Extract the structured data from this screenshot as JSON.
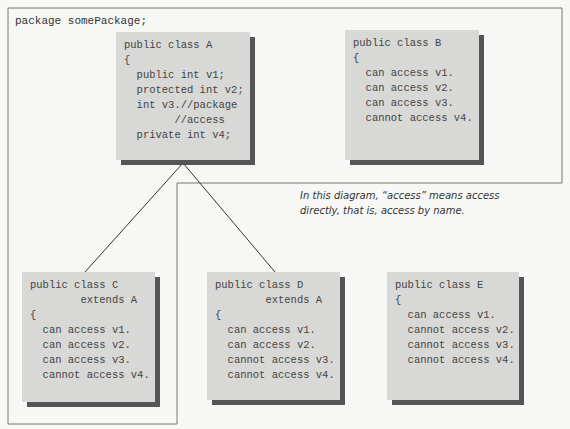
{
  "package": {
    "label": "package somePackage;"
  },
  "classes": {
    "A": {
      "lines": [
        "public class A",
        "{",
        "  public int v1;",
        "  protected int v2;",
        "  int v3.//package",
        "        //access",
        "  private int v4;"
      ]
    },
    "B": {
      "lines": [
        "public class B",
        "{",
        "  can access v1.",
        "  can access v2.",
        "  can access v3.",
        "  cannot access v4."
      ]
    },
    "C": {
      "lines": [
        "public class C",
        "        extends A",
        "{",
        "  can access v1.",
        "  can access v2.",
        "  can access v3.",
        "  cannot access v4."
      ]
    },
    "D": {
      "lines": [
        "public class D",
        "        extends A",
        "{",
        "  can access v1.",
        "  can access v2.",
        "  cannot access v3.",
        "  cannot access v4."
      ]
    },
    "E": {
      "lines": [
        "public class E",
        "{",
        "  can access v1.",
        "  cannot access v2.",
        "  cannot access v3.",
        "  cannot access v4."
      ]
    }
  },
  "note": {
    "line1": "In this diagram, “access” means access",
    "line2": "directly, that is, access by name."
  }
}
